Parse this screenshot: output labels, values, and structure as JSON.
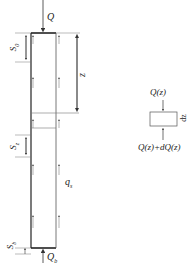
{
  "pile_diagram": {
    "top_load": "Q",
    "tip_load": "Q",
    "tip_load_sub": "b",
    "depth_label": "z",
    "friction_label": "q",
    "friction_label_sub": "s",
    "settlement_top": "S",
    "settlement_top_sub": "0",
    "settlement_mid": "S",
    "settlement_mid_sub": "z",
    "settlement_tip": "S",
    "settlement_tip_sub": "b"
  },
  "element_diagram": {
    "top_force": "Q(z)",
    "bottom_force": "Q(z)+dQ(z)",
    "thickness": "dz"
  },
  "colors": {
    "line": "#333333",
    "pile_outline": "#222222",
    "thin": "#666666"
  }
}
